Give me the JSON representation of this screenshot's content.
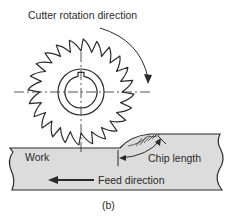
{
  "figure": {
    "caption": "(b)",
    "labels": {
      "rotation": "Cutter rotation direction",
      "work": "Work",
      "chip_length": "Chip length",
      "feed": "Feed direction"
    },
    "cutter": {
      "center": [
        81,
        92
      ],
      "outer_radius": 53,
      "root_radius": 41,
      "teeth": 24,
      "hub_radius": 23,
      "bore_radius": 16
    },
    "colors": {
      "line": "#2a2a2a",
      "work_fill": "#dcdcdc",
      "background": "#ffffff"
    }
  }
}
